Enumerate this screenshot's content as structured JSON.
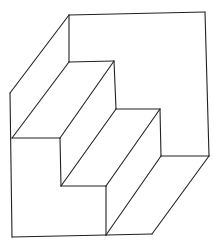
{
  "figure": {
    "stroke_color": "#222222",
    "background": "#ffffff",
    "segments": [
      {
        "name": "back-wall-top-edge",
        "x1": 69,
        "y1": 15,
        "x2": 205,
        "y2": 12
      },
      {
        "name": "right-wall-edge",
        "x1": 205,
        "y1": 12,
        "x2": 209,
        "y2": 156
      },
      {
        "name": "left-slant-top-edge",
        "x1": 69,
        "y1": 15,
        "x2": 10,
        "y2": 93
      },
      {
        "name": "left-outer-edge",
        "x1": 10,
        "y1": 93,
        "x2": 12,
        "y2": 237
      },
      {
        "name": "back-wall-vertical",
        "x1": 69,
        "y1": 15,
        "x2": 69,
        "y2": 62
      },
      {
        "name": "step1-back-edge",
        "x1": 69,
        "y1": 62,
        "x2": 114,
        "y2": 61
      },
      {
        "name": "step1-back-riser",
        "x1": 114,
        "y1": 61,
        "x2": 116,
        "y2": 109
      },
      {
        "name": "step2-back-edge",
        "x1": 116,
        "y1": 109,
        "x2": 160,
        "y2": 109
      },
      {
        "name": "step2-back-riser",
        "x1": 160,
        "y1": 109,
        "x2": 161,
        "y2": 156
      },
      {
        "name": "floor-back-edge",
        "x1": 161,
        "y1": 156,
        "x2": 209,
        "y2": 156
      },
      {
        "name": "step1-front-edge",
        "x1": 12,
        "y1": 138,
        "x2": 60,
        "y2": 138
      },
      {
        "name": "step1-front-riser",
        "x1": 60,
        "y1": 138,
        "x2": 61,
        "y2": 186
      },
      {
        "name": "step2-front-edge",
        "x1": 61,
        "y1": 186,
        "x2": 106,
        "y2": 186
      },
      {
        "name": "step2-front-riser",
        "x1": 106,
        "y1": 186,
        "x2": 106,
        "y2": 235
      },
      {
        "name": "bottom-edge",
        "x1": 12,
        "y1": 237,
        "x2": 106,
        "y2": 235
      },
      {
        "name": "floor-front-edge",
        "x1": 106,
        "y1": 235,
        "x2": 152,
        "y2": 234
      },
      {
        "name": "diag-step1-left",
        "x1": 69,
        "y1": 62,
        "x2": 12,
        "y2": 138
      },
      {
        "name": "diag-step1-right",
        "x1": 114,
        "y1": 61,
        "x2": 60,
        "y2": 138
      },
      {
        "name": "diag-step2-left",
        "x1": 116,
        "y1": 109,
        "x2": 61,
        "y2": 186
      },
      {
        "name": "diag-step2-right",
        "x1": 160,
        "y1": 109,
        "x2": 106,
        "y2": 186
      },
      {
        "name": "diag-floor-left",
        "x1": 161,
        "y1": 156,
        "x2": 106,
        "y2": 235
      },
      {
        "name": "diag-floor-right",
        "x1": 209,
        "y1": 156,
        "x2": 152,
        "y2": 234
      }
    ]
  }
}
